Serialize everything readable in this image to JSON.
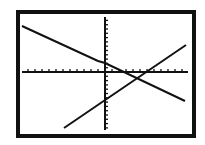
{
  "chart_data": {
    "type": "line",
    "title": "",
    "xlabel": "",
    "ylabel": "",
    "grid": false,
    "axes": {
      "x_ticks_left": 12,
      "x_ticks_right": 11,
      "y_ticks_up": 13,
      "y_ticks_down": 13
    },
    "xlim": [
      -12,
      11
    ],
    "ylim": [
      -13,
      13
    ],
    "series": [
      {
        "name": "decreasing line",
        "x": [
          -11,
          -1,
          0,
          10
        ],
        "y": [
          9.5,
          2.5,
          2,
          -6
        ],
        "color": "#111111"
      },
      {
        "name": "increasing line",
        "x": [
          -5,
          10
        ],
        "y": [
          -12,
          6.5
        ],
        "color": "#111111"
      }
    ],
    "annotations": []
  }
}
